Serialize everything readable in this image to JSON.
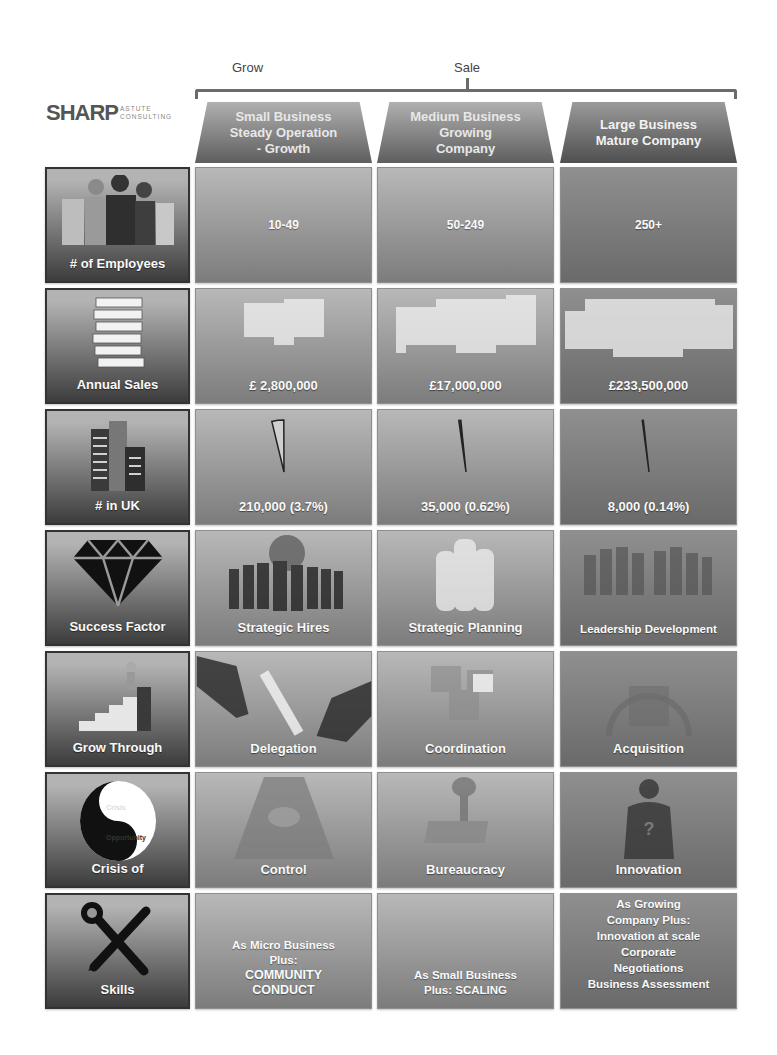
{
  "top_labels": {
    "grow": "Grow",
    "sale": "Sale"
  },
  "logo": {
    "main": "SHARP",
    "sub1": "ASTUTE",
    "sub2": "CONSULTING"
  },
  "columns": [
    {
      "lines": [
        "Small Business",
        "Steady Operation",
        "- Growth"
      ]
    },
    {
      "lines": [
        "Medium Business",
        "Growing",
        "Company"
      ]
    },
    {
      "lines": [
        "Large Business",
        "Mature Company"
      ]
    }
  ],
  "rows": [
    {
      "header": "# of Employees",
      "icon": "people-icon",
      "cells": [
        "10-49",
        "50-249",
        "250+"
      ]
    },
    {
      "header": "Annual Sales",
      "icon": "banknotes-icon",
      "cells": [
        "£ 2,800,000",
        "£17,000,000",
        "£233,500,000"
      ]
    },
    {
      "header": "# in UK",
      "icon": "buildings-icon",
      "cells": [
        "210,000 (3.7%)",
        "35,000 (0.62%)",
        "8,000 (0.14%)"
      ],
      "share_percent": [
        3.7,
        0.62,
        0.14
      ]
    },
    {
      "header": "Success Factor",
      "icon": "diamond-icon",
      "cells": [
        "Strategic Hires",
        "Strategic Planning",
        "Leadership Development"
      ]
    },
    {
      "header": "Grow Through",
      "icon": "stairs-climber-icon",
      "cells": [
        "Delegation",
        "Coordination",
        "Acquisition"
      ]
    },
    {
      "header": "Crisis of",
      "icon": "yin-yang-icon",
      "icon_text": [
        "Crisis",
        "Opportunity"
      ],
      "cells": [
        "Control",
        "Bureaucracy",
        "Innovation"
      ]
    },
    {
      "header": "Skills",
      "icon": "tools-icon",
      "cells": [
        [
          "As Micro Business",
          "Plus:",
          "COMMUNITY",
          "CONDUCT"
        ],
        [
          "As Small Business",
          "Plus: SCALING"
        ],
        [
          "As Growing",
          "Company Plus:",
          "Innovation at scale",
          "Corporate",
          "Negotiations",
          "Business Assessment"
        ]
      ]
    }
  ]
}
